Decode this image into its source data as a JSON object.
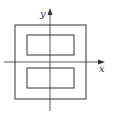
{
  "diagram": {
    "axes": {
      "x_label": "x",
      "y_label": "y",
      "line_color": "#333333"
    },
    "shapes": {
      "outer_square": {
        "x": 15,
        "y": 25,
        "w": 71,
        "h": 74
      },
      "inner_top_rect": {
        "x": 27,
        "y": 35,
        "w": 47,
        "h": 20
      },
      "inner_bottom_rect": {
        "x": 27,
        "y": 68,
        "w": 47,
        "h": 20
      }
    }
  }
}
